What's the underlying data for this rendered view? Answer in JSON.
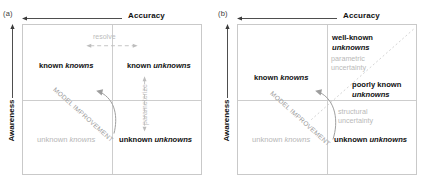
{
  "figure": {
    "panels": [
      {
        "id": "a",
        "label": "(a)",
        "x_axis": {
          "title": "Accuracy",
          "arrow_direction": "left"
        },
        "y_axis": {
          "title": "Awareness",
          "arrow_direction": "up"
        },
        "quadrants": {
          "top_left": {
            "word1": "known",
            "word2": "knowns",
            "style": "bold"
          },
          "top_right": {
            "word1": "known",
            "word2": "unknowns",
            "style": "bold"
          },
          "bottom_left": {
            "word1": "unknown",
            "word2": "knowns",
            "style": "faded"
          },
          "bottom_right": {
            "word1": "unknown",
            "word2": "unknowns",
            "style": "bold"
          }
        },
        "annotations": {
          "resolve": "resolve",
          "parameterize": "parameterize",
          "model_improvement": "MODEL IMPROVEMENT"
        }
      },
      {
        "id": "b",
        "label": "(b)",
        "x_axis": {
          "title": "Accuracy",
          "arrow_direction": "left"
        },
        "y_axis": {
          "title": "Awareness",
          "arrow_direction": "up"
        },
        "quadrants": {
          "top_left": {
            "word1": "known",
            "word2": "knowns",
            "style": "bold"
          },
          "bottom_left": {
            "word1": "unknown",
            "word2": "knowns",
            "style": "faded"
          },
          "bottom_right": {
            "word1": "unknown",
            "word2": "unknowns",
            "style": "bold"
          }
        },
        "sub_quadrants": {
          "well_known": {
            "line1": "well-known",
            "line2": "unknowns"
          },
          "poorly_known": {
            "line1": "poorly known",
            "line2": "unknowns"
          }
        },
        "uncertainty_labels": {
          "parametric": {
            "line1": "parametric",
            "line2": "uncertainty"
          },
          "structural": {
            "line1": "structural",
            "line2": "uncertainty"
          }
        },
        "annotations": {
          "model_improvement": "MODEL IMPROVEMENT"
        }
      }
    ],
    "colors": {
      "bold_text": "#111111",
      "faded_text": "#b6b6b6",
      "frame": "#c9c9c9",
      "divider": "#cdcdcd",
      "annotation": "#9d9d9d"
    }
  }
}
